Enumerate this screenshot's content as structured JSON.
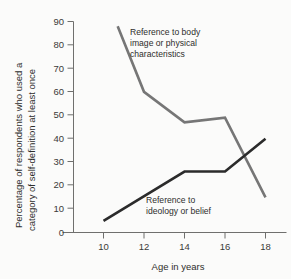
{
  "chart_data": {
    "type": "line",
    "title": "",
    "xlabel": "Age in years",
    "ylabel": "Percentage of respondents who used a category of self-definition at least once",
    "ylabel_line1": "Percentage of respondents who used a",
    "ylabel_line2": "category of self-definition at least once",
    "xlim": [
      9.0,
      18.6
    ],
    "ylim": [
      0,
      90
    ],
    "xticks": [
      10,
      12,
      14,
      16,
      18
    ],
    "xtick_labels": [
      "10",
      "12",
      "14",
      "16",
      "18"
    ],
    "yticks": [
      0,
      10,
      20,
      30,
      40,
      50,
      60,
      70,
      80,
      90
    ],
    "ytick_labels": [
      "0",
      "10",
      "20",
      "30",
      "40",
      "50",
      "60",
      "70",
      "80",
      "90"
    ],
    "grid": false,
    "legend": "inline-annotations",
    "series": [
      {
        "name": "Reference to body image or physical characteristics",
        "color": "#767676",
        "x": [
          10.7,
          12.0,
          14.0,
          16.0,
          18.0
        ],
        "values": [
          88,
          60,
          47,
          49,
          15
        ],
        "annotation_lines": [
          "Reference to body",
          "image or physical",
          "characteristics"
        ]
      },
      {
        "name": "Reference to ideology or belief",
        "color": "#2b2b2b",
        "x": [
          10.0,
          14.0,
          16.0,
          18.0
        ],
        "values": [
          5,
          26,
          26,
          40
        ],
        "annotation_lines": [
          "Reference to",
          "ideology or belief"
        ]
      }
    ],
    "colors": {
      "background": "#fbfbfa",
      "axis": "#6f6f6d",
      "text": "#2e2e2c",
      "series_gray": "#767676",
      "series_black": "#2b2b2b"
    }
  }
}
